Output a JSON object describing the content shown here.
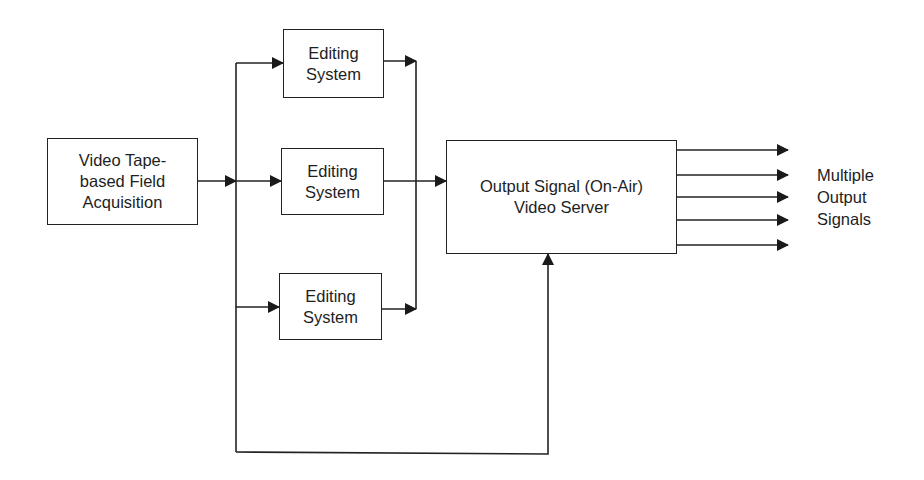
{
  "diagram": {
    "type": "block-flow",
    "nodes": {
      "source": {
        "label": "Video Tape-\nbased Field\nAcquisition"
      },
      "editor_top": {
        "label": "Editing\nSystem"
      },
      "editor_middle": {
        "label": "Editing\nSystem"
      },
      "editor_bottom": {
        "label": "Editing\nSystem"
      },
      "server": {
        "label": "Output Signal (On-Air)\nVideo Server"
      }
    },
    "outputs": {
      "count": 5,
      "label": "Multiple\nOutput\nSignals"
    },
    "edges": [
      {
        "from": "source",
        "to": "editor_top"
      },
      {
        "from": "source",
        "to": "editor_middle"
      },
      {
        "from": "source",
        "to": "editor_bottom"
      },
      {
        "from": "editor_top",
        "to": "server"
      },
      {
        "from": "editor_middle",
        "to": "server"
      },
      {
        "from": "editor_bottom",
        "to": "server"
      },
      {
        "from": "source",
        "to": "server",
        "route": "bypass-bottom"
      },
      {
        "from": "server",
        "to": "outputs",
        "count": 5
      }
    ],
    "colors": {
      "line": "#222222",
      "background": "#ffffff"
    }
  }
}
